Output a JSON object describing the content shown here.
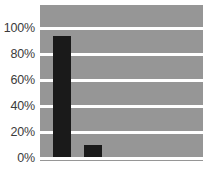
{
  "chart_data": {
    "type": "bar",
    "title": "",
    "subtitle": "",
    "xlabel": "",
    "ylabel": "",
    "categories": [
      "",
      ""
    ],
    "values": [
      93,
      9
    ],
    "ylim": [
      0,
      100
    ],
    "yticks": [
      0,
      20,
      40,
      60,
      80,
      100
    ],
    "ytick_labels": [
      "0%",
      "20%",
      "40%",
      "60%",
      "80%",
      "100%"
    ],
    "grid": true,
    "grid_axis": "y",
    "legend": false,
    "legend_position": "none",
    "series": [
      {
        "name": "",
        "values": [
          93,
          9
        ]
      }
    ],
    "colors": {
      "bar": "#1a1a1a",
      "plot_background": "#969696",
      "gridline": "#ffffff",
      "figure_background": "#ffffff",
      "tick_label": "#3b3b3b"
    }
  }
}
